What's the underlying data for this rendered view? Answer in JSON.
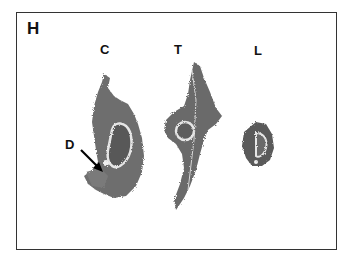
{
  "figure": {
    "panel_label": "H",
    "section_labels": {
      "cervical": "C",
      "thoracic": "T",
      "lumbar": "L"
    },
    "annotation": {
      "label": "D",
      "arrow": "arrow pointing to region D on C section"
    },
    "colors": {
      "tissue": "#6b6b6b",
      "tissue_dark": "#4a4a4a",
      "highlight": "#e8e8e8",
      "border": "#333333"
    }
  }
}
